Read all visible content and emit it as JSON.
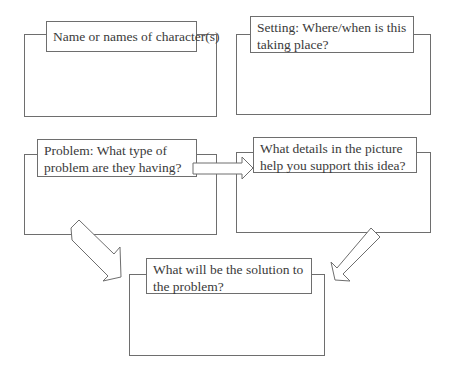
{
  "organizer": {
    "boxes": [
      {
        "id": "characters",
        "label": "Name or names of character(s)"
      },
      {
        "id": "setting",
        "label": "Setting: Where/when is this taking place?"
      },
      {
        "id": "problem",
        "label": "Problem: What type of problem are they having?"
      },
      {
        "id": "details",
        "label": "What details in the picture help you support this idea?"
      },
      {
        "id": "solution",
        "label": "What will be the solution to the problem?"
      }
    ],
    "arrows": [
      {
        "from": "problem",
        "to": "details",
        "direction": "right"
      },
      {
        "from": "problem",
        "to": "solution",
        "direction": "down-right"
      },
      {
        "from": "details",
        "to": "solution",
        "direction": "down-left"
      }
    ]
  }
}
